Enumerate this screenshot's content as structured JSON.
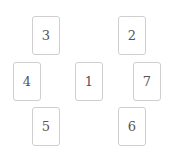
{
  "cards": [
    {
      "label": "1",
      "x": 75,
      "y": 62
    },
    {
      "label": "2",
      "x": 118,
      "y": 16
    },
    {
      "label": "3",
      "x": 32,
      "y": 16
    },
    {
      "label": "4",
      "x": 13,
      "y": 62
    },
    {
      "label": "5",
      "x": 32,
      "y": 107
    },
    {
      "label": "6",
      "x": 118,
      "y": 107
    },
    {
      "label": "7",
      "x": 133,
      "y": 62
    }
  ]
}
